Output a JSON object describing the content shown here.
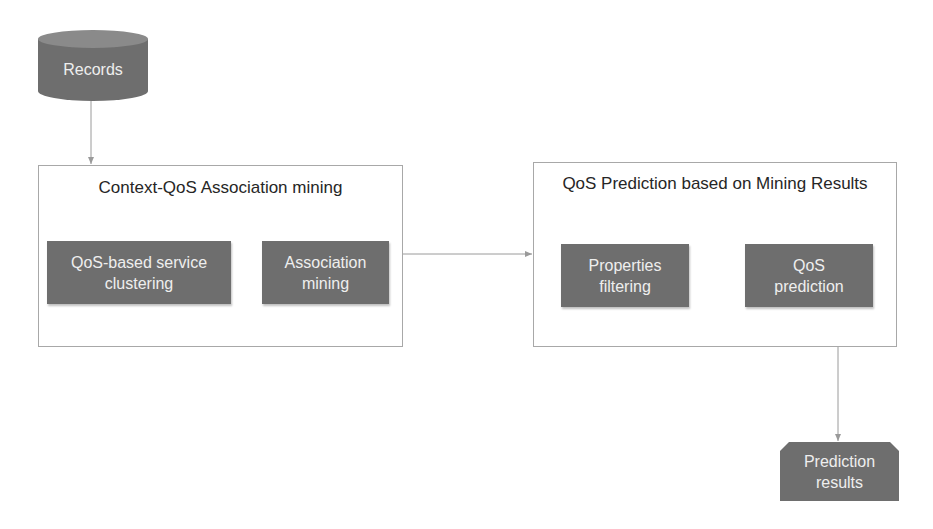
{
  "diagram": {
    "nodes": {
      "records": {
        "label": "Records",
        "shape": "cylinder"
      },
      "context_box": {
        "title": "Context-QoS Association mining",
        "steps": [
          {
            "line1": "QoS-based service",
            "line2": "clustering"
          },
          {
            "line1": "Association",
            "line2": "mining"
          }
        ]
      },
      "prediction_box": {
        "title": "QoS Prediction based on Mining Results",
        "steps": [
          {
            "line1": "Properties",
            "line2": "filtering"
          },
          {
            "line1": "QoS",
            "line2": "prediction"
          }
        ]
      },
      "results": {
        "line1": "Prediction",
        "line2": "results",
        "shape": "snipped-rectangle"
      }
    },
    "edges": [
      {
        "from": "Records",
        "to": "Context-QoS Association mining"
      },
      {
        "from": "Context-QoS Association mining",
        "to": "QoS Prediction based on Mining Results"
      },
      {
        "from": "QoS Prediction based on Mining Results",
        "to": "Prediction results"
      }
    ],
    "colors": {
      "node_fill": "#6e6e6e",
      "node_text": "#eeeeee",
      "container_border": "#a8a8a8",
      "connector": "#9a9a9a",
      "title_text": "#262626"
    }
  }
}
